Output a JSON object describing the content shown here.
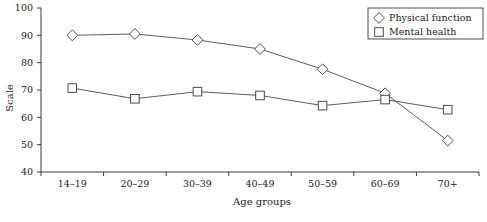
{
  "chart_data": {
    "type": "line",
    "title": "",
    "xlabel": "Age groups",
    "ylabel": "Scale",
    "categories": [
      "14–19",
      "20–29",
      "30–39",
      "40–49",
      "50–59",
      "60–69",
      "70+"
    ],
    "ylim": [
      40,
      100
    ],
    "yticks": [
      40,
      50,
      60,
      70,
      80,
      90,
      100
    ],
    "ytick_labels": [
      "40",
      "50",
      "60",
      "70",
      "80",
      "90",
      "100"
    ],
    "grid": false,
    "legend_position": "top-right",
    "series": [
      {
        "name": "Physical function",
        "marker": "diamond",
        "values": [
          90.0,
          90.5,
          88.3,
          85.0,
          77.6,
          68.8,
          51.5
        ]
      },
      {
        "name": "Mental health",
        "marker": "square",
        "values": [
          70.7,
          66.8,
          69.4,
          68.0,
          64.3,
          66.5,
          62.8
        ]
      }
    ]
  },
  "legend": {
    "entries": [
      {
        "label": "Physical function",
        "marker": "diamond-marker"
      },
      {
        "label": "Mental health",
        "marker": "square-marker"
      }
    ]
  },
  "axes": {
    "y_title": "Scale",
    "x_title": "Age groups"
  },
  "colors": {
    "line": "#4a4a4a",
    "axis": "#3a3a3a",
    "marker_fill": "#ffffff",
    "background": "#ffffff",
    "text": "#1a1a1a"
  }
}
